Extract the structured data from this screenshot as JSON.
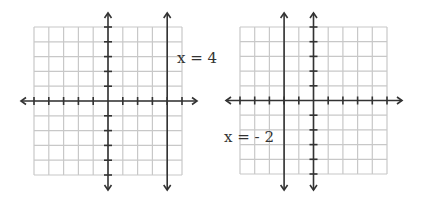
{
  "graphs": [
    {
      "id": "left",
      "grid": {
        "xmin": -5,
        "xmax": 5,
        "ymin": -5,
        "ymax": 5
      },
      "line": {
        "type": "vertical",
        "x": 4
      },
      "label": "x = 4"
    },
    {
      "id": "right",
      "grid": {
        "xmin": -5,
        "xmax": 5,
        "ymin": -5,
        "ymax": 5
      },
      "line": {
        "type": "vertical",
        "x": -2
      },
      "label": "x = - 2"
    }
  ],
  "colors": {
    "grid": "#c8c8c8",
    "axis": "#333333",
    "line": "#333333",
    "text": "#333333"
  }
}
